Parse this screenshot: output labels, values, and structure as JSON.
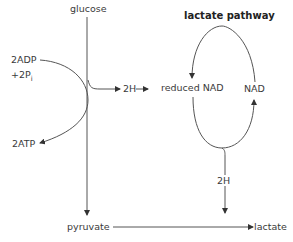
{
  "diagram": {
    "title": "lactate pathway",
    "nodes": {
      "glucose": "glucose",
      "adp": "2ADP",
      "pi_prefix": "+2P",
      "pi_sub": "i",
      "atp": "2ATP",
      "h_left": "2H",
      "reduced_nad": "reduced NAD",
      "nad": "NAD",
      "h_bottom": "2H",
      "pyruvate": "pyruvate",
      "lactate": "lactate"
    },
    "edges": [
      {
        "from": "glucose",
        "to": "pyruvate"
      },
      {
        "from": "2ADP +2Pi",
        "to": "2ATP"
      },
      {
        "from": "glucose",
        "to": "2H"
      },
      {
        "from": "2H",
        "to": "reduced NAD"
      },
      {
        "from": "NAD",
        "to": "reduced NAD",
        "via": "cycle top"
      },
      {
        "from": "reduced NAD",
        "to": "NAD",
        "via": "cycle bottom"
      },
      {
        "from": "cycle",
        "to": "2H (bottom)"
      },
      {
        "from": "2H (bottom)",
        "to": "lactate junction"
      },
      {
        "from": "pyruvate",
        "to": "lactate"
      }
    ],
    "colors": {
      "line": "#4a4a4a",
      "text": "#3a3a3a"
    }
  }
}
